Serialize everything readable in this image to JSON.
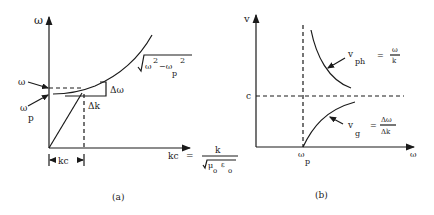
{
  "panel_a": {
    "caption": "(a)",
    "y_axis_label": "ω",
    "curve_label_sqrt_body_1": "ω",
    "curve_label_exp_1": "2",
    "curve_label_minus": "−ω",
    "curve_label_sub_p": "p",
    "curve_label_exp_2": "2",
    "omega_label": "ω",
    "omega_p_label": "ω",
    "omega_p_sub": "p",
    "delta_omega_label": "Δω",
    "delta_k_label": "Δk",
    "kc_bracket_label": "kc",
    "x_axis_label_lhs": "kc",
    "x_axis_equals": "=",
    "x_axis_numerator": "k",
    "x_axis_denominator_mu": "μ",
    "x_axis_denominator_mu_sub": "o",
    "x_axis_denominator_eps": "ε",
    "x_axis_denominator_eps_sub": "o"
  },
  "panel_b": {
    "caption": "(b)",
    "y_axis_label": "v",
    "x_axis_label": "ω",
    "c_label": "c",
    "omega_p_label": "ω",
    "omega_p_sub": "p",
    "vph_label": "v",
    "vph_sub": "ph",
    "vph_equals": "=",
    "vph_num": "ω",
    "vph_den": "k",
    "vg_label": "v",
    "vg_sub": "g",
    "vg_equals": "=",
    "vg_num": "Δω",
    "vg_den": "Δk"
  },
  "colors": {
    "ink": "#1a1a1a",
    "background": "#ffffff"
  }
}
